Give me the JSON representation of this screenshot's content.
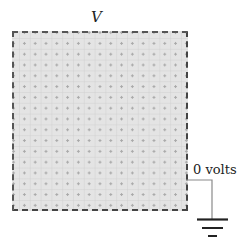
{
  "diagram": {
    "potential_label": "V",
    "ground_label": "0 volts",
    "components": [
      "conducting-plate",
      "ground-wire",
      "ground-symbol"
    ],
    "colors": {
      "plate_fill": "#e4e4e4",
      "border": "#555555",
      "wire": "#888888",
      "ground": "#222222"
    }
  }
}
